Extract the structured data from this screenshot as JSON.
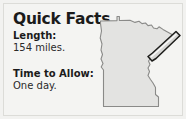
{
  "card": {
    "title": "Quick Facts",
    "facts": [
      {
        "label": "Length:",
        "value": "154 miles."
      },
      {
        "label": "Time to Allow:",
        "value": "One day."
      }
    ]
  },
  "map": {
    "name": "minnesota-state-map",
    "state_fill": "#e3e3e1",
    "state_outline": "#8a8a88",
    "route_fill": "#d6d6d4",
    "route_outline": "#1d1d1b",
    "route_name": "highlighted-scenic-route"
  },
  "colors": {
    "card_background": "#f4f4f2",
    "card_border": "#dcdcd8",
    "page_background": "#ffffff",
    "heading_text": "#1b1b1b",
    "body_text": "#2a2a2a"
  }
}
